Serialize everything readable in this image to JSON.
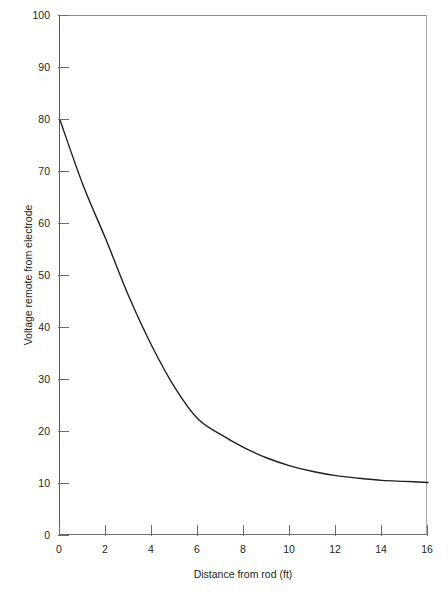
{
  "chart_data": {
    "type": "line",
    "title": "",
    "subtitle": "",
    "xlabel": "Distance from rod (ft)",
    "ylabel": "Voltage remote from electrode",
    "xlim": [
      0,
      16
    ],
    "ylim": [
      0,
      100
    ],
    "xticks": [
      0,
      2,
      4,
      6,
      8,
      10,
      12,
      14,
      16
    ],
    "yticks": [
      0,
      10,
      20,
      30,
      40,
      50,
      60,
      70,
      80,
      90,
      100
    ],
    "xtick_labels": [
      "0",
      "2",
      "4",
      "6",
      "8",
      "10",
      "12",
      "14",
      "16"
    ],
    "ytick_labels": [
      "0",
      "10",
      "20",
      "30",
      "40",
      "50",
      "60",
      "70",
      "80",
      "90",
      "100"
    ],
    "grid": false,
    "legend": null,
    "annotations": [],
    "series": [
      {
        "name": "Voltage remote from electrode",
        "color": "#231f20",
        "linewidth": 1.4,
        "x": [
          0,
          1,
          2,
          3,
          4,
          5,
          6,
          7,
          8,
          9,
          10,
          11,
          12,
          13,
          14,
          15,
          16
        ],
        "y": [
          80.0,
          67.5,
          57.0,
          46.0,
          36.5,
          28.5,
          22.5,
          19.5,
          17.0,
          15.0,
          13.5,
          12.4,
          11.6,
          11.1,
          10.7,
          10.5,
          10.3
        ]
      }
    ]
  },
  "figure": {
    "axis_color": "#6b6b6b",
    "text_color": "#231f20",
    "background": "#ffffff"
  }
}
